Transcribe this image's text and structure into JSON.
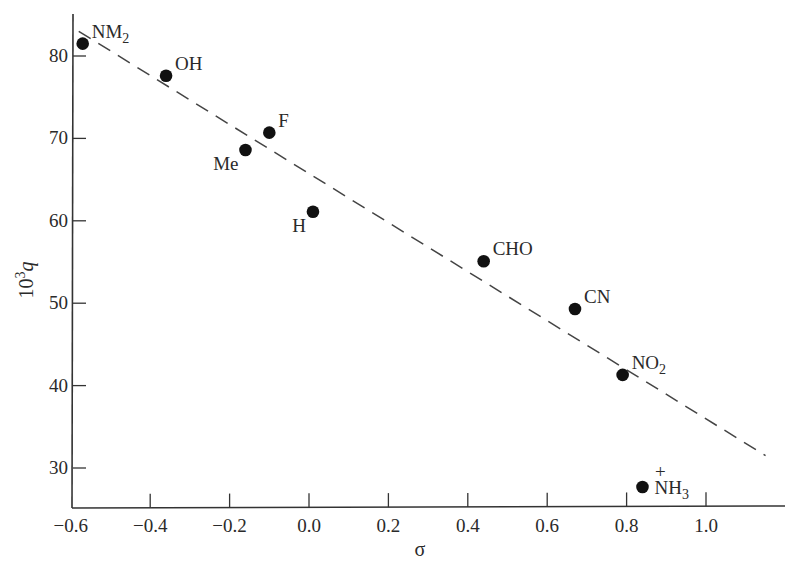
{
  "chart_data": {
    "type": "scatter",
    "title": "",
    "xlabel": "σ",
    "ylabel": "10³q",
    "ylabel_parts": {
      "base": "10",
      "sup": "3",
      "var": "q"
    },
    "xlim": [
      -0.6,
      1.16
    ],
    "ylim": [
      25,
      86
    ],
    "grid": false,
    "legend": null,
    "x_ticks": [
      -0.6,
      -0.4,
      -0.2,
      0.0,
      0.2,
      0.4,
      0.6,
      0.8,
      1.0
    ],
    "x_tick_labels": [
      "−0.6",
      "−0.4",
      "−0.2",
      "0.0",
      "0.2",
      "0.4",
      "0.6",
      "0.8",
      "1.0"
    ],
    "y_ticks": [
      30,
      40,
      50,
      60,
      70,
      80
    ],
    "y_tick_labels": [
      "30",
      "40",
      "50",
      "60",
      "70",
      "80"
    ],
    "points": [
      {
        "label": "NM₂",
        "label_main": "NM",
        "label_sub": "2",
        "label_sup": "",
        "x": -0.57,
        "y": 81.5,
        "label_pos": "upper-right"
      },
      {
        "label": "OH",
        "label_main": "OH",
        "label_sub": "",
        "label_sup": "",
        "x": -0.36,
        "y": 77.6,
        "label_pos": "upper-right"
      },
      {
        "label": "F",
        "label_main": "F",
        "label_sub": "",
        "label_sup": "",
        "x": -0.1,
        "y": 70.7,
        "label_pos": "upper-right"
      },
      {
        "label": "Me",
        "label_main": "Me",
        "label_sub": "",
        "label_sup": "",
        "x": -0.16,
        "y": 68.6,
        "label_pos": "lower-left"
      },
      {
        "label": "H",
        "label_main": "H",
        "label_sub": "",
        "label_sup": "",
        "x": 0.01,
        "y": 61.1,
        "label_pos": "lower-left"
      },
      {
        "label": "CHO",
        "label_main": "CHO",
        "label_sub": "",
        "label_sup": "",
        "x": 0.44,
        "y": 55.1,
        "label_pos": "upper-right"
      },
      {
        "label": "CN",
        "label_main": "CN",
        "label_sub": "",
        "label_sup": "",
        "x": 0.67,
        "y": 49.3,
        "label_pos": "upper-right"
      },
      {
        "label": "NO₂",
        "label_main": "NO",
        "label_sub": "2",
        "label_sup": "",
        "x": 0.79,
        "y": 41.3,
        "label_pos": "upper-right"
      },
      {
        "label": "N⁺H₃",
        "label_main": "NH",
        "label_sub": "3",
        "label_sup": "+",
        "x": 0.84,
        "y": 27.7,
        "label_pos": "right"
      }
    ],
    "fit_line": {
      "style": "dashed",
      "x": [
        -0.58,
        1.15
      ],
      "y": [
        83.0,
        31.5
      ]
    }
  }
}
